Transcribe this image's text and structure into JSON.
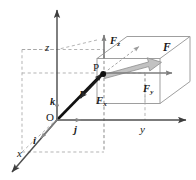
{
  "figure": {
    "colors": {
      "axis": "#4f4f4f",
      "box_edge": "#9a9a9a",
      "dashed": "#9a9a9a",
      "force_vector": "#b9b9b9",
      "force_vector_edge": "#8c8c8c",
      "position_vector": "#111111",
      "unit_vector": "#7d7d7d",
      "label": "#1a1a1a",
      "background": "#ffffff"
    },
    "axes": [
      {
        "id": "x",
        "label": "x",
        "direction": "down-left"
      },
      {
        "id": "y",
        "label": "y",
        "direction": "right"
      },
      {
        "id": "z",
        "label": "z",
        "direction": "up"
      }
    ],
    "points": [
      {
        "id": "origin",
        "label": "O",
        "style": "upright"
      },
      {
        "id": "point-p",
        "label": "P",
        "style": "upright"
      }
    ],
    "unit_vectors": [
      {
        "id": "i",
        "label": "i",
        "axis": "x"
      },
      {
        "id": "j",
        "label": "j",
        "axis": "y"
      },
      {
        "id": "k",
        "label": "k",
        "axis": "z"
      }
    ],
    "vectors": [
      {
        "id": "r",
        "label": "r",
        "description": "position vector from O to P"
      },
      {
        "id": "F",
        "label": "F",
        "description": "force vector at P"
      }
    ],
    "components": [
      {
        "id": "Fx",
        "base": "F",
        "sub": "x",
        "description": "x component of F"
      },
      {
        "id": "Fy",
        "base": "F",
        "sub": "y",
        "description": "y component of F"
      },
      {
        "id": "Fz",
        "base": "F",
        "sub": "z",
        "description": "z component of F"
      }
    ]
  }
}
